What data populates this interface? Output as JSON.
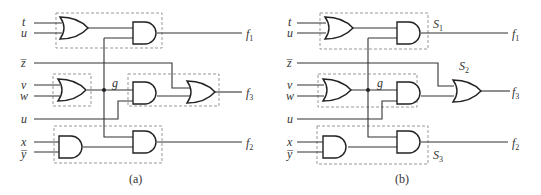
{
  "figure": {
    "panels": [
      {
        "id": "a",
        "caption": "(a)",
        "inputs": [
          "t",
          "u",
          "z̅",
          "v",
          "w",
          "u",
          "x",
          "y̅"
        ],
        "node_label": "g",
        "outputs": [
          "f",
          "f",
          "f"
        ],
        "output_subscripts": [
          "1",
          "3",
          "2"
        ],
        "subsystem_labels": []
      },
      {
        "id": "b",
        "caption": "(b)",
        "inputs": [
          "t",
          "u",
          "z̅",
          "v",
          "w",
          "u",
          "x",
          "y̅"
        ],
        "node_label": "g",
        "outputs": [
          "f",
          "f",
          "f"
        ],
        "output_subscripts": [
          "1",
          "3",
          "2"
        ],
        "subsystem_labels": [
          "S",
          "S",
          "S"
        ],
        "subsystem_subscripts": [
          "1",
          "2",
          "3"
        ]
      }
    ],
    "gates": [
      "OR",
      "AND",
      "OR",
      "AND",
      "OR",
      "AND",
      "AND"
    ],
    "colors": {
      "line": "#333333",
      "box": "#999999",
      "background": "#ffffff"
    }
  }
}
